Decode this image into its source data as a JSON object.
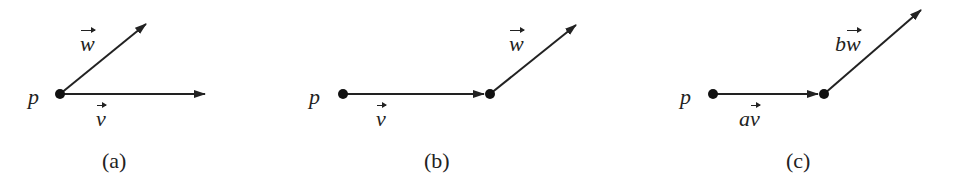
{
  "figure": {
    "panels": [
      {
        "caption": "(a)",
        "point_label": "p",
        "v_label": "v",
        "w_label": "w"
      },
      {
        "caption": "(b)",
        "point_label": "p",
        "v_label": "v",
        "w_label": "w"
      },
      {
        "caption": "(c)",
        "point_label": "p",
        "v_coef": "a",
        "v_label": "v",
        "w_coef": "b",
        "w_label": "w"
      }
    ],
    "colors": {
      "ink": "#222222",
      "background": "#ffffff"
    }
  }
}
